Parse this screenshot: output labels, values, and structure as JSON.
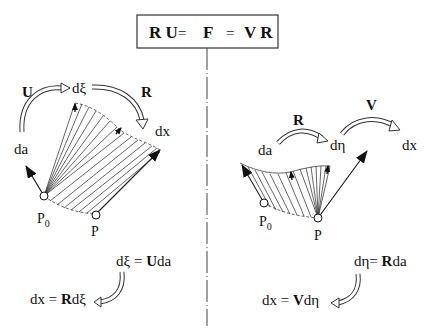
{
  "title_box": {
    "part1": "R U",
    "eq1": "=",
    "part2": "F",
    "eq2": "=",
    "part3": "V R"
  },
  "left_panel": {
    "arrow_U_label": "U",
    "arrow_R_label": "R",
    "da_label": "da",
    "dxi_label": "dξ",
    "dx_label": "dx",
    "p0_label": "P",
    "p0_sub": "0",
    "p_label": "P",
    "formula1": {
      "lhs": "dξ",
      "eq": "=",
      "rhs_bold": "U",
      "rhs_rest": "da"
    },
    "formula2": {
      "lhs": "dx",
      "eq": "=",
      "rhs_bold": "R",
      "rhs_rest": "dξ"
    }
  },
  "right_panel": {
    "arrow_R_label": "R",
    "arrow_V_label": "V",
    "da_label": "da",
    "deta_label": "dη",
    "dx_label": "dx",
    "p0_label": "P",
    "p0_sub": "0",
    "p_label": "P",
    "formula1": {
      "lhs": "dη",
      "eq": "=",
      "rhs_bold": "R",
      "rhs_rest": "da"
    },
    "formula2": {
      "lhs": "dx",
      "eq": "=",
      "rhs_bold": "V",
      "rhs_rest": "dη"
    }
  },
  "colors": {
    "ink": "#111111",
    "background": "#ffffff"
  }
}
